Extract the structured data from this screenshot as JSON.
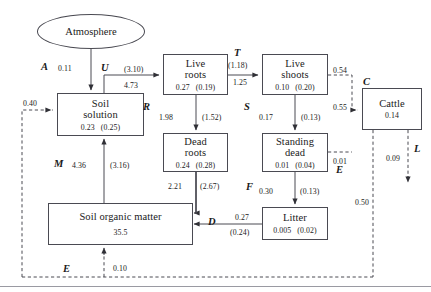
{
  "diagram": {
    "nodes": [
      {
        "id": "atmosphere",
        "label": "Atmosphere",
        "shape": "ellipse",
        "value": "",
        "sd": ""
      },
      {
        "id": "soil-solution",
        "label_line1": "Soil",
        "label_line2": "solution",
        "value": "0.23",
        "sd": "(0.25)"
      },
      {
        "id": "live-roots",
        "label_line1": "Live",
        "label_line2": "roots",
        "value": "0.27",
        "sd": "(0.19)"
      },
      {
        "id": "dead-roots",
        "label_line1": "Dead",
        "label_line2": "roots",
        "value": "0.24",
        "sd": "(0.28)"
      },
      {
        "id": "live-shoots",
        "label_line1": "Live",
        "label_line2": "shoots",
        "value": "0.10",
        "sd": "(0.20)"
      },
      {
        "id": "standing-dead",
        "label_line1": "Standing",
        "label_line2": "dead",
        "value": "0.01",
        "sd": "(0.04)"
      },
      {
        "id": "cattle",
        "label_line1": "Cattle",
        "label_line2": "",
        "value": "0.14",
        "sd": ""
      },
      {
        "id": "litter",
        "label_line1": "Litter",
        "label_line2": "",
        "value": "0.005",
        "sd": "(0.02)"
      },
      {
        "id": "soil-organic-matter",
        "label_line1": "Soil organic matter",
        "label_line2": "",
        "value": "35.5",
        "sd": ""
      }
    ],
    "fluxes": [
      {
        "id": "A",
        "symbol": "A",
        "value": "0.11",
        "sd": "",
        "from": "atmosphere",
        "to": "soil-solution"
      },
      {
        "id": "U",
        "symbol": "U",
        "value": "4.73",
        "sd": "(3.10)",
        "from": "soil-solution",
        "to": "live-roots"
      },
      {
        "id": "R",
        "symbol": "R",
        "value": "1.98",
        "sd": "(1.52)",
        "from": "live-roots",
        "to": "dead-roots"
      },
      {
        "id": "T",
        "symbol": "T",
        "value": "1.25",
        "sd": "(1.18)",
        "from": "live-roots",
        "to": "live-shoots"
      },
      {
        "id": "S",
        "symbol": "S",
        "value": "0.17",
        "sd": "(0.13)",
        "from": "live-shoots",
        "to": "standing-dead"
      },
      {
        "id": "C",
        "symbol": "C",
        "value": "0.55",
        "sd": "",
        "from": "live-shoots",
        "to": "cattle"
      },
      {
        "id": "C-out",
        "symbol": "",
        "value": "0.54",
        "sd": "",
        "from": "live-shoots",
        "to": "cattle-branch"
      },
      {
        "id": "SD-cattle",
        "symbol": "",
        "value": "0.01",
        "sd": "",
        "from": "standing-dead",
        "to": "cattle-branch"
      },
      {
        "id": "F",
        "symbol": "F",
        "value": "0.30",
        "sd": "(0.13)",
        "from": "standing-dead",
        "to": "litter"
      },
      {
        "id": "D",
        "symbol": "D",
        "value": "0.27",
        "sd": "(0.24)",
        "from": "litter",
        "to": "soil-organic-matter"
      },
      {
        "id": "DR-SOM",
        "symbol": "",
        "value": "2.21",
        "sd": "(2.67)",
        "from": "dead-roots",
        "to": "soil-organic-matter"
      },
      {
        "id": "M",
        "symbol": "M",
        "value": "4.36",
        "sd": "(3.16)",
        "from": "soil-organic-matter",
        "to": "soil-solution"
      },
      {
        "id": "E-soil-solution",
        "symbol": "",
        "value": "0.40",
        "sd": "",
        "from": "excreta",
        "to": "soil-solution"
      },
      {
        "id": "E-som",
        "symbol": "E",
        "value": "0.10",
        "sd": "",
        "from": "excreta",
        "to": "soil-organic-matter"
      },
      {
        "id": "E-cattle",
        "symbol": "E",
        "value": "0.50",
        "sd": "",
        "from": "cattle",
        "to": "excreta"
      },
      {
        "id": "L",
        "symbol": "L",
        "value": "0.09",
        "sd": "",
        "from": "cattle",
        "to": "loss"
      }
    ],
    "flux_symbols": {
      "A": "A",
      "U": "U",
      "R": "R",
      "T": "T",
      "S": "S",
      "C": "C",
      "F": "F",
      "D": "D",
      "M": "M",
      "E": "E",
      "L": "L"
    },
    "colors": {
      "stroke": "#4a4a52",
      "text": "#1a1a1a",
      "background": "#ffffff"
    }
  }
}
